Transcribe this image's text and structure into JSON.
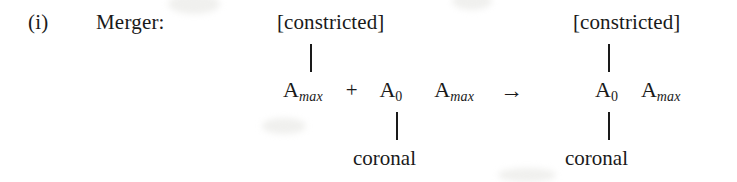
{
  "rule": {
    "enumeration": "(i)",
    "name": "Merger:",
    "operator_arrow": "→"
  },
  "input": {
    "top_feature": "[constricted]",
    "bottom_feature": "coronal",
    "segments": [
      {
        "root": "A",
        "subscript": "max",
        "subscript_style": "italic"
      },
      {
        "operator": "+"
      },
      {
        "root": "A",
        "subscript": "0",
        "subscript_style": "upright"
      },
      {
        "root": "A",
        "subscript": "max",
        "subscript_style": "italic"
      }
    ],
    "top_link_target": "A_max_first",
    "bottom_link_target": "A_0"
  },
  "output": {
    "top_feature": "[constricted]",
    "bottom_feature": "coronal",
    "segments": [
      {
        "root": "A",
        "subscript": "0",
        "subscript_style": "upright"
      },
      {
        "root": "A",
        "subscript": "max",
        "subscript_style": "italic"
      }
    ],
    "top_link_target": "A_0",
    "bottom_link_target": "A_0"
  }
}
